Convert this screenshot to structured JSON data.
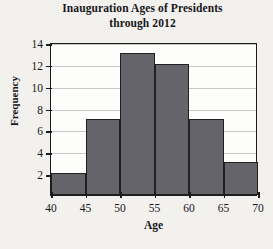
{
  "chart_data": {
    "type": "bar",
    "title": "Inauguration Ages of Presidents through 2012",
    "title_line1": "Inauguration Ages of Presidents",
    "title_line2": "through 2012",
    "xlabel": "Age",
    "ylabel": "Frequency",
    "categories": [
      "40-45",
      "45-50",
      "50-55",
      "55-60",
      "60-65",
      "65-70"
    ],
    "bin_edges": [
      40,
      45,
      50,
      55,
      60,
      65,
      70
    ],
    "values": [
      2,
      7,
      13,
      12,
      7,
      3
    ],
    "xlim": [
      40,
      70
    ],
    "ylim": [
      0,
      14
    ],
    "xticks": [
      40,
      45,
      50,
      55,
      60,
      65,
      70
    ],
    "yticks": [
      2,
      4,
      6,
      8,
      10,
      12,
      14
    ],
    "grid": true,
    "legend": null,
    "bar_color": "#65646a",
    "bar_edge_color": "#211f24",
    "axis_color": "#1b1a1e",
    "grid_color": "#c9c8c6",
    "plot_background": "#fdfdfc",
    "page_background": "#f2f1ee"
  }
}
